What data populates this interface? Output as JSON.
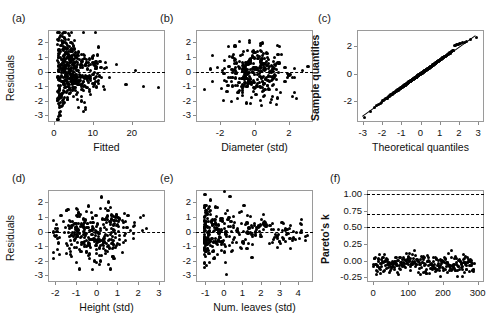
{
  "figure": {
    "background": "#ffffff",
    "point_color": "#000000",
    "frame_color": "#9a9a9a"
  },
  "panels": [
    {
      "letter": "(a)",
      "name": "residuals-vs-fitted",
      "xlabel": "Fitted",
      "ylabel": "Residuals",
      "ylabel_bold": false,
      "xticks": [
        "0",
        "10",
        "20"
      ],
      "xtick_values": [
        0,
        10,
        20
      ],
      "yticks": [
        "2",
        "1",
        "0",
        "-1",
        "-2",
        "-3"
      ],
      "ytick_values": [
        2,
        1,
        0,
        -1,
        -2,
        -3
      ],
      "xlim": [
        -1.5,
        28.5
      ],
      "ylim": [
        -3.45,
        2.85
      ],
      "reference_line": 0
    },
    {
      "letter": "(b)",
      "name": "residuals-vs-diameter",
      "xlabel": "Diameter (std)",
      "ylabel": "",
      "ylabel_bold": false,
      "xticks": [
        "-2",
        "0",
        "2"
      ],
      "xtick_values": [
        -2,
        0,
        2
      ],
      "yticks": [
        "2",
        "1",
        "0",
        "-1",
        "-2",
        "-3"
      ],
      "ytick_values": [
        2,
        1,
        0,
        -1,
        -2,
        -3
      ],
      "xlim": [
        -3.4,
        3.4
      ],
      "ylim": [
        -3.45,
        2.85
      ],
      "reference_line": 0
    },
    {
      "letter": "(c)",
      "name": "qq-plot",
      "xlabel": "Theoretical quantiles",
      "ylabel": "Sample quantiles",
      "ylabel_bold": true,
      "xticks": [
        "-3",
        "-2",
        "-1",
        "0",
        "1",
        "2",
        "3"
      ],
      "xtick_values": [
        -3,
        -2,
        -1,
        0,
        1,
        2,
        3
      ],
      "yticks": [
        "2",
        "0",
        "-2"
      ],
      "ytick_values": [
        2,
        0,
        -2
      ],
      "xlim": [
        -3.3,
        3.3
      ],
      "ylim": [
        -3.5,
        3.2
      ],
      "reference_line": null
    },
    {
      "letter": "(d)",
      "name": "residuals-vs-height",
      "xlabel": "Height (std)",
      "ylabel": "Residuals",
      "ylabel_bold": false,
      "xticks": [
        "-2",
        "-1",
        "0",
        "1",
        "2",
        "3"
      ],
      "xtick_values": [
        -2,
        -1,
        0,
        1,
        2,
        3
      ],
      "yticks": [
        "2",
        "1",
        "0",
        "-1",
        "-2",
        "-3"
      ],
      "ytick_values": [
        2,
        1,
        0,
        -1,
        -2,
        -3
      ],
      "xlim": [
        -2.35,
        3.3
      ],
      "ylim": [
        -3.45,
        2.85
      ],
      "reference_line": 0
    },
    {
      "letter": "(e)",
      "name": "residuals-vs-num-leaves",
      "xlabel": "Num. leaves (std)",
      "ylabel": "",
      "ylabel_bold": false,
      "xticks": [
        "-1",
        "0",
        "1",
        "2",
        "3",
        "4"
      ],
      "xtick_values": [
        -1,
        0,
        1,
        2,
        3,
        4
      ],
      "yticks": [
        "2",
        "1",
        "0",
        "-1",
        "-2",
        "-3"
      ],
      "ytick_values": [
        2,
        1,
        0,
        -1,
        -2,
        -3
      ],
      "xlim": [
        -1.5,
        4.8
      ],
      "ylim": [
        -3.45,
        2.85
      ],
      "reference_line": 0
    },
    {
      "letter": "(f)",
      "name": "pareto-k-diagnostic",
      "xlabel": "",
      "ylabel": "Pareto's k",
      "ylabel_bold": true,
      "xticks": [
        "0",
        "100",
        "200",
        "300"
      ],
      "xtick_values": [
        0,
        100,
        200,
        300
      ],
      "yticks": [
        "1.00",
        "0.75",
        "0.50",
        "0.25",
        "0.00",
        "-0.25"
      ],
      "ytick_values": [
        1.0,
        0.75,
        0.5,
        0.25,
        0.0,
        -0.25
      ],
      "xlim": [
        -18,
        318
      ],
      "ylim": [
        -0.32,
        1.06
      ],
      "threshold_lines": [
        1.0,
        0.7,
        0.5
      ]
    }
  ],
  "chart_data": [
    {
      "type": "scatter",
      "panel": "(a)",
      "title": "",
      "xlabel": "Fitted",
      "ylabel": "Residuals",
      "xlim": [
        -1.5,
        28.5
      ],
      "ylim": [
        -3.45,
        2.85
      ],
      "grid": false,
      "annotations": [
        "dashed horizontal reference line at residual = 0"
      ],
      "n_points": 300,
      "x": [
        1.2,
        1.4,
        1.5,
        1.6,
        1.8,
        1.9,
        2.0,
        2.0,
        2.1,
        2.2,
        2.2,
        2.3,
        2.3,
        2.4,
        2.4,
        2.5,
        2.5,
        2.6,
        2.6,
        2.7,
        2.7,
        2.8,
        2.8,
        2.9,
        2.9,
        3.0,
        3.0,
        3.0,
        3.1,
        3.1,
        3.2,
        3.2,
        3.3,
        3.3,
        3.4,
        3.4,
        3.5,
        3.5,
        3.6,
        3.6,
        3.7,
        3.7,
        3.8,
        3.8,
        3.9,
        3.9,
        4.0,
        4.0,
        4.1,
        4.1,
        4.2,
        4.2,
        4.3,
        4.3,
        4.4,
        4.4,
        4.5,
        4.5,
        4.6,
        4.6,
        4.7,
        4.7,
        4.8,
        4.8,
        4.9,
        4.9,
        5.0,
        5.0,
        5.1,
        5.1,
        5.2,
        5.2,
        5.3,
        5.3,
        5.4,
        5.4,
        5.5,
        5.5,
        5.6,
        5.7,
        5.8,
        5.9,
        6.0,
        6.1,
        6.2,
        6.3,
        6.4,
        6.5,
        6.6,
        6.8,
        7.0,
        7.2,
        7.4,
        7.6,
        7.8,
        8.0,
        8.3,
        8.6,
        9.0,
        9.4,
        9.8,
        10.3,
        10.8,
        11.4,
        12.0,
        12.8,
        13.5,
        14.2,
        16.0,
        18.5,
        21.0,
        23.0,
        26.8,
        1.3,
        1.7,
        2.1,
        2.4,
        2.6,
        2.8,
        3.0,
        3.2,
        3.4,
        3.6,
        3.8,
        4.0,
        4.2,
        4.4,
        4.6,
        4.8,
        5.0,
        5.2,
        5.4,
        5.6,
        5.8,
        6.0,
        6.3,
        6.6,
        7.0,
        7.5,
        8.0,
        8.5,
        9.2,
        10.0,
        11.0,
        12.2,
        13.2,
        1.5,
        1.9,
        2.2,
        2.5,
        2.7,
        2.9,
        3.1,
        3.3,
        3.5,
        3.7,
        3.9,
        4.1,
        4.3,
        4.5,
        4.7,
        4.9,
        5.1,
        5.3,
        5.5,
        5.7,
        6.0,
        6.4,
        6.8,
        7.3,
        7.9,
        8.6,
        9.5,
        10.5,
        11.8,
        13.0,
        1.6,
        2.0,
        2.3,
        2.6,
        2.9,
        3.2,
        3.5,
        3.8,
        4.1,
        4.4,
        4.7,
        5.0,
        5.3,
        5.6,
        6.0,
        6.5,
        7.0,
        7.6,
        8.3,
        9.1,
        10.2,
        11.5,
        13.0,
        1.8,
        2.2,
        2.5,
        2.8,
        3.1,
        3.4,
        3.7,
        4.0,
        4.3,
        4.6,
        4.9,
        5.2,
        5.6,
        6.1,
        6.7,
        7.4,
        8.2,
        9.3,
        10.6,
        12.1,
        2.0,
        2.4,
        2.7,
        3.0,
        3.3,
        3.6,
        3.9,
        4.2,
        4.5,
        4.8,
        5.2,
        5.7,
        6.3,
        7.1,
        8.0,
        9.2,
        10.8,
        1.4,
        1.8,
        2.2,
        2.6,
        3.0,
        3.4,
        3.8,
        4.2,
        4.6,
        5.0,
        5.5,
        6.1,
        6.9,
        7.9,
        9.1,
        2.3,
        2.9,
        3.5,
        4.1,
        4.7,
        5.4,
        6.2,
        7.2,
        8.4,
        9.9,
        11.6,
        1.7,
        2.5,
        3.3,
        4.1,
        5.0,
        6.0,
        7.2,
        8.8,
        2.8,
        4.0,
        5.5,
        7.5,
        10.0
      ],
      "y": [
        -3.1,
        -2.8,
        -1.2,
        0.5,
        1.4,
        -0.3,
        2.1,
        -1.6,
        0.8,
        -0.7,
        1.9,
        0.2,
        -2.0,
        1.1,
        -0.4,
        0.6,
        -1.3,
        1.6,
        -0.9,
        0.3,
        2.3,
        -1.8,
        0.9,
        -0.2,
        1.3,
        0.0,
        -1.1,
        2.0,
        0.7,
        -0.6,
        1.5,
        -1.4,
        0.4,
        -0.1,
        1.8,
        -0.8,
        0.5,
        -1.9,
        1.0,
        -0.3,
        2.2,
        0.2,
        -1.0,
        1.2,
        -0.5,
        0.8,
        -1.5,
        1.7,
        0.1,
        -0.9,
        1.4,
        -0.2,
        0.6,
        -1.2,
        2.0,
        -0.4,
        1.1,
        0.3,
        -0.7,
        1.6,
        -1.3,
        0.5,
        -0.1,
        1.9,
        0.8,
        -0.6,
        1.2,
        -1.7,
        0.4,
        0.0,
        1.5,
        -0.3,
        0.9,
        -1.1,
        0.6,
        -0.5,
        1.3,
        0.2,
        -0.8,
        1.0,
        -0.2,
        0.7,
        -1.4,
        0.5,
        -0.6,
        1.1,
        0.1,
        -0.9,
        0.8,
        -0.4,
        1.2,
        -1.0,
        0.3,
        -0.7,
        0.9,
        -0.3,
        0.6,
        -1.1,
        0.4,
        -0.5,
        1.0,
        -0.8,
        0.2,
        -0.6,
        0.7,
        -1.0,
        0.3,
        -0.4,
        0.5,
        -0.9,
        0.1,
        -1.0,
        -1.1,
        -1.4,
        2.5,
        -1.5,
        1.7,
        -2.1,
        0.9,
        -0.4,
        1.3,
        0.6,
        -1.8,
        0.2,
        1.0,
        -0.7,
        1.5,
        -0.3,
        0.8,
        -1.2,
        0.4,
        1.1,
        -0.6,
        0.1,
        -0.9,
        1.4,
        -0.2,
        0.7,
        -1.3,
        0.5,
        -0.5,
        0.9,
        -0.8,
        0.3,
        -0.4,
        0.6,
        0.4,
        1.8,
        -2.3,
        0.7,
        1.2,
        -1.0,
        0.3,
        -0.6,
        1.6,
        0.0,
        -1.5,
        0.8,
        -0.2,
        1.0,
        0.5,
        -1.1,
        0.2,
        -0.7,
        1.3,
        -0.4,
        0.6,
        -0.9,
        0.4,
        -0.3,
        0.9,
        -0.6,
        0.1,
        -0.5,
        0.7,
        -1.2,
        -0.4,
        -1.6,
        1.5,
        -0.8,
        2.2,
        0.4,
        -1.3,
        1.0,
        -0.1,
        0.7,
        -0.9,
        1.8,
        0.3,
        -0.5,
        1.2,
        -0.7,
        0.5,
        -1.0,
        0.8,
        -0.3,
        0.6,
        -0.8,
        0.2,
        -0.6,
        0.6,
        -1.9,
        1.1,
        0.2,
        -0.5,
        1.4,
        -1.1,
        0.7,
        0.1,
        -0.8,
        1.6,
        -0.2,
        0.9,
        -0.6,
        0.4,
        -1.0,
        0.5,
        -0.4,
        0.3,
        -0.7,
        -2.2,
        0.8,
        -0.3,
        1.9,
        0.5,
        -1.2,
        0.2,
        1.0,
        -0.7,
        0.6,
        -0.4,
        1.3,
        -0.9,
        0.4,
        -0.5,
        0.7,
        -0.6,
        -1.7,
        2.4,
        0.1,
        -0.6,
        1.6,
        0.4,
        -1.4,
        0.9,
        -0.2,
        1.1,
        -0.8,
        0.3,
        -0.5,
        0.8,
        -0.7,
        1.3,
        -1.0,
        0.6,
        -0.4,
        2.1,
        -0.7,
        0.5,
        -1.1,
        0.9,
        -0.3,
        0.2,
        -1.4,
        0.9,
        -0.5,
        1.7,
        0.1,
        -0.9,
        0.6,
        -0.6,
        0.4,
        -1.3,
        1.2,
        -0.2,
        0.5
      ]
    },
    {
      "type": "scatter",
      "panel": "(b)",
      "title": "",
      "xlabel": "Diameter (std)",
      "ylabel": "Residuals",
      "xlim": [
        -3.4,
        3.4
      ],
      "ylim": [
        -3.45,
        2.85
      ],
      "grid": false,
      "annotations": [
        "dashed horizontal reference line at residual = 0"
      ],
      "n_points": 300
    },
    {
      "type": "scatter",
      "panel": "(c)",
      "title": "",
      "xlabel": "Theoretical quantiles",
      "ylabel": "Sample quantiles",
      "xlim": [
        -3.3,
        3.3
      ],
      "ylim": [
        -3.5,
        3.2
      ],
      "grid": false,
      "annotations": [
        "45-degree reference line through the quantile pairs"
      ],
      "n_points": 300
    },
    {
      "type": "scatter",
      "panel": "(d)",
      "title": "",
      "xlabel": "Height (std)",
      "ylabel": "Residuals",
      "xlim": [
        -2.35,
        3.3
      ],
      "ylim": [
        -3.45,
        2.85
      ],
      "grid": false,
      "annotations": [
        "dashed horizontal reference line at residual = 0"
      ],
      "n_points": 300
    },
    {
      "type": "scatter",
      "panel": "(e)",
      "title": "",
      "xlabel": "Num. leaves (std)",
      "ylabel": "Residuals",
      "xlim": [
        -1.5,
        4.8
      ],
      "ylim": [
        -3.45,
        2.85
      ],
      "grid": false,
      "annotations": [
        "dashed horizontal reference line at residual = 0"
      ],
      "n_points": 300
    },
    {
      "type": "scatter",
      "panel": "(f)",
      "title": "",
      "xlabel": "",
      "ylabel": "Pareto's k",
      "xlim": [
        -18,
        318
      ],
      "ylim": [
        -0.32,
        1.06
      ],
      "grid": false,
      "annotations": [
        "dashed threshold lines at k = 0.5, 0.7 and 1.0"
      ],
      "n_points": 290,
      "k_range": [
        -0.22,
        0.3
      ]
    }
  ]
}
